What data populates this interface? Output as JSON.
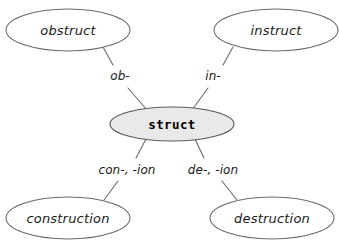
{
  "diagram": {
    "type": "concept-map",
    "background_color": "#ffffff",
    "stroke_color": "#6b6b6b",
    "center_fill_color": "#e9e9e9",
    "node_fill_color": "#ffffff",
    "text_color": "#1a1a1a",
    "center": {
      "id": "struct",
      "label": "struct",
      "cx": 172,
      "cy": 124,
      "rx": 62,
      "ry": 17
    },
    "nodes": [
      {
        "id": "obstruct",
        "label": "obstruct",
        "cx": 68,
        "cy": 30,
        "rx": 62,
        "ry": 21
      },
      {
        "id": "instruct",
        "label": "instruct",
        "cx": 276,
        "cy": 30,
        "rx": 62,
        "ry": 21
      },
      {
        "id": "construction",
        "label": "construction",
        "cx": 68,
        "cy": 218,
        "rx": 62,
        "ry": 21
      },
      {
        "id": "destruction",
        "label": "destruction",
        "cx": 272,
        "cy": 218,
        "rx": 62,
        "ry": 21
      }
    ],
    "edges": [
      {
        "id": "edge-obstruct",
        "from": "obstruct",
        "to": "struct",
        "label": "ob-",
        "label_x": 120,
        "label_y": 76,
        "seg1": {
          "x1": 103,
          "y1": 47,
          "x2": 113,
          "y2": 65
        },
        "seg2": {
          "x1": 128,
          "y1": 88,
          "x2": 147,
          "y2": 110
        }
      },
      {
        "id": "edge-instruct",
        "from": "instruct",
        "to": "struct",
        "label": "in-",
        "label_x": 213,
        "label_y": 76,
        "seg1": {
          "x1": 233,
          "y1": 47,
          "x2": 223,
          "y2": 65
        },
        "seg2": {
          "x1": 208,
          "y1": 88,
          "x2": 192,
          "y2": 110
        }
      },
      {
        "id": "edge-construction",
        "from": "struct",
        "to": "construction",
        "label": "con-, -ion",
        "label_x": 127,
        "label_y": 170,
        "seg1": {
          "x1": 146,
          "y1": 139,
          "x2": 136,
          "y2": 158
        },
        "seg2": {
          "x1": 118,
          "y1": 181,
          "x2": 104,
          "y2": 200
        }
      },
      {
        "id": "edge-destruction",
        "from": "struct",
        "to": "destruction",
        "label": "de-, -ion",
        "label_x": 213,
        "label_y": 170,
        "seg1": {
          "x1": 195,
          "y1": 139,
          "x2": 204,
          "y2": 158
        },
        "seg2": {
          "x1": 222,
          "y1": 181,
          "x2": 237,
          "y2": 200
        }
      }
    ]
  }
}
